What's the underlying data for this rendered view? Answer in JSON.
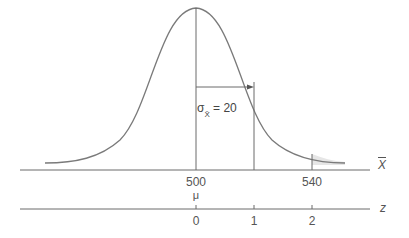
{
  "diagram": {
    "type": "normal-distribution",
    "sigma_label": "σ",
    "sigma_subscript": "X̄",
    "sigma_value_text": "= 20",
    "x_axis": {
      "label": "X",
      "ticks": [
        {
          "value": "500",
          "sub": "μ"
        },
        {
          "value": "540"
        }
      ]
    },
    "z_axis": {
      "label": "z",
      "ticks": [
        "0",
        "1",
        "2"
      ]
    },
    "colors": {
      "curve": "#7a7a7a",
      "line": "#6a6a6a",
      "shade": "#e6e6e6"
    }
  }
}
